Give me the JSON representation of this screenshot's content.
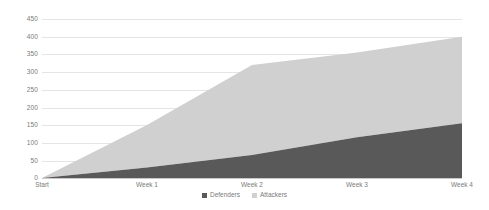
{
  "chart_data": {
    "type": "area",
    "stacked": true,
    "title": "",
    "subtitle": "",
    "xlabel": "",
    "ylabel": "",
    "categories": [
      "Start",
      "Week 1",
      "Week 2",
      "Week 3",
      "Week 4"
    ],
    "series": [
      {
        "name": "Defenders",
        "color": "#595959",
        "values": [
          0,
          30,
          65,
          115,
          155
        ]
      },
      {
        "name": "Attackers",
        "color": "#d0d0d0",
        "values": [
          0,
          120,
          255,
          240,
          245
        ]
      }
    ],
    "cumulative_totals": [
      0,
      150,
      320,
      355,
      400
    ],
    "ylim": [
      0,
      450
    ],
    "ytick_step": 50,
    "yticks": [
      "450",
      "400",
      "350",
      "300",
      "250",
      "200",
      "150",
      "100",
      "50",
      "0"
    ],
    "xticks": [
      "Start",
      "Week 1",
      "Week 2",
      "Week 3",
      "Week 4"
    ],
    "grid": true,
    "grid_color": "#e4e4e4",
    "legend_position": "bottom",
    "legend": [
      {
        "label": "Defenders",
        "color": "#595959",
        "marker": "square-filled"
      },
      {
        "label": "Attackers",
        "color": "#d0d0d0",
        "marker": "square-light"
      }
    ],
    "axis_label_color": "#7a7a7a",
    "background": "#ffffff"
  }
}
